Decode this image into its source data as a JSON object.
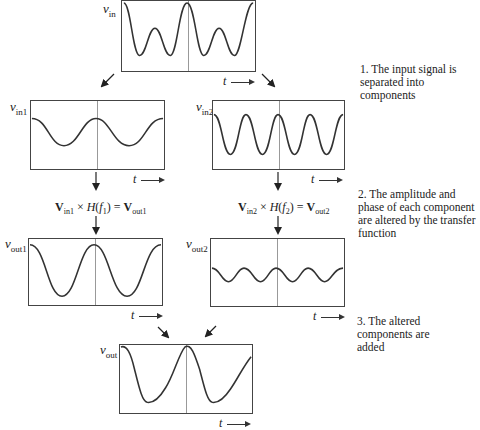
{
  "diagram": {
    "t_axis_label": "t",
    "panels": {
      "vin": {
        "label_main": "v",
        "label_sub": "in",
        "description": "input signal (sum of two components)"
      },
      "vin1": {
        "label_main": "v",
        "label_sub": "in1",
        "description": "low-frequency component"
      },
      "vin2": {
        "label_main": "v",
        "label_sub": "in2",
        "description": "high-frequency component (2x frequency)"
      },
      "vout1": {
        "label_main": "v",
        "label_sub": "out1",
        "description": "component 1 after transfer function (larger amplitude)"
      },
      "vout2": {
        "label_main": "v",
        "label_sub": "out2",
        "description": "component 2 after transfer function (smaller amplitude, shifted phase)"
      },
      "vout": {
        "label_main": "v",
        "label_sub": "out",
        "description": "sum of altered components"
      }
    },
    "equations": {
      "eq1": {
        "V": "V",
        "in_sub": "in1",
        "times": " × ",
        "H": "H",
        "f": "f",
        "f_sub": "1",
        "eq": " = ",
        "out_sub": "out1"
      },
      "eq2": {
        "V": "V",
        "in_sub": "in2",
        "times": " × ",
        "H": "H",
        "f": "f",
        "f_sub": "2",
        "eq": " = ",
        "out_sub": "out2"
      }
    },
    "notes": [
      "1. The input signal is separated into components",
      "2. The amplitude and phase of each component are altered by the transfer function",
      "3. The altered components are added"
    ],
    "colors": {
      "trace": "#333333",
      "border": "#444444",
      "midline": "#999999",
      "background": "#ffffff"
    }
  }
}
